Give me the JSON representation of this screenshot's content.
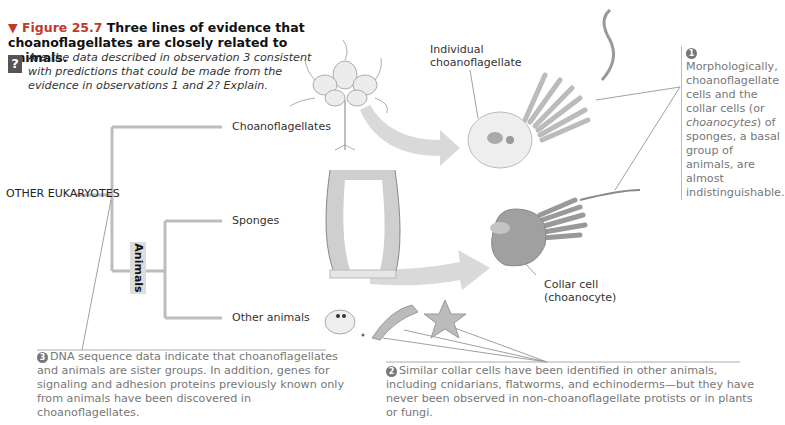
{
  "figure": {
    "label": "▼ Figure 25.7",
    "title": "Three lines of evidence that choanoflagellates are closely related to animals.",
    "question_icon": "?",
    "question": "Are the data described in observation 3 consistent with predictions that could be made from the evidence in observations 1 and 2? Explain."
  },
  "tree": {
    "root": "OTHER EUKARYOTES",
    "clade_label": "Animals",
    "tips": [
      "Choanoflagellates",
      "Sponges",
      "Other animals"
    ],
    "line_color": "#bdbdbd"
  },
  "illustrations": {
    "choanoflagellate_label": "Individual choanoflagellate",
    "collar_cell_label_line1": "Collar cell",
    "collar_cell_label_line2": "(choanocyte)",
    "arrow_color": "#d9d9d9"
  },
  "observations": [
    {
      "number": "1",
      "text_before_italic": "Morphologically, choanoflagellate cells and the collar cells (or ",
      "italic": "choanocytes",
      "text_after_italic": ") of sponges, a basal group of animals, are almost indistinguishable."
    },
    {
      "number": "2",
      "text": "Similar collar cells have been identified in other animals, including cnidarians, flatworms, and echinoderms—but they have never been observed in non-choanoflagellate protists or in plants or fungi."
    },
    {
      "number": "3",
      "text": "DNA sequence data indicate that choanoflagellates and animals are sister groups. In addition, genes for signaling and adhesion proteins previously known only from animals have been discovered in choanoflagellates."
    }
  ]
}
